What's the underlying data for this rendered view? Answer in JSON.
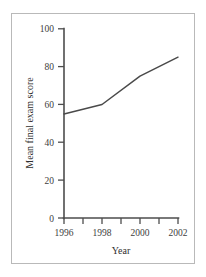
{
  "chart_data": {
    "type": "line",
    "title": "",
    "xlabel": "Year",
    "ylabel": "Mean final exam score",
    "x": [
      1996,
      1998,
      2000,
      2002
    ],
    "values": [
      55,
      60,
      75,
      85
    ],
    "series": [
      {
        "name": "Mean final exam score",
        "values": [
          55,
          60,
          75,
          85
        ],
        "color": "#4a4a4a"
      }
    ],
    "xlim": [
      1996,
      2002
    ],
    "ylim": [
      0,
      100
    ],
    "x_tick_labels": [
      "1996",
      "1998",
      "2000",
      "2002"
    ],
    "x_tick_label_values": [
      1996,
      1998,
      2000,
      2002
    ],
    "x_minor_ticks": [
      1996,
      1997,
      1998,
      1999,
      2000,
      2001,
      2002
    ],
    "y_tick_labels": [
      "0",
      "20",
      "40",
      "60",
      "80",
      "100"
    ],
    "y_tick_values": [
      0,
      20,
      40,
      60,
      80,
      100
    ],
    "grid": false,
    "legend": "none"
  },
  "axis_titles": {
    "x": "Year",
    "y": "Mean final exam score"
  },
  "y_ticks": {
    "t0": "0",
    "t20": "20",
    "t40": "40",
    "t60": "60",
    "t80": "80",
    "t100": "100"
  },
  "x_ticks": {
    "t1996": "1996",
    "t1998": "1998",
    "t2000": "2000",
    "t2002": "2002"
  },
  "colors": {
    "line": "#4a4a4a",
    "axis": "#4d4d4d",
    "border": "#b9b9b9",
    "background": "#ffffff"
  }
}
